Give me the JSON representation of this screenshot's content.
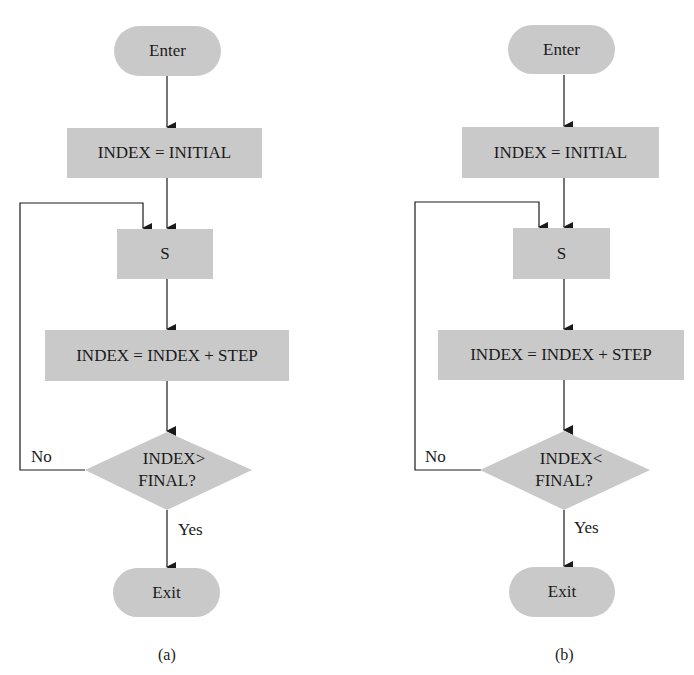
{
  "diagrams": [
    {
      "id": "a",
      "caption": "(a)",
      "enter": "Enter",
      "init": "INDEX = INITIAL",
      "body": "S",
      "step": "INDEX = INDEX + STEP",
      "test_line1": "INDEX>",
      "test_line2": "FINAL?",
      "no_label": "No",
      "yes_label": "Yes",
      "exit": "Exit"
    },
    {
      "id": "b",
      "caption": "(b)",
      "enter": "Enter",
      "init": "INDEX = INITIAL",
      "body": "S",
      "step": "INDEX = INDEX + STEP",
      "test_line1": "INDEX<",
      "test_line2": "FINAL?",
      "no_label": "No",
      "yes_label": "Yes",
      "exit": "Exit"
    }
  ],
  "colors": {
    "shape_fill": "#c9c9c9",
    "line": "#1a1a1a"
  }
}
